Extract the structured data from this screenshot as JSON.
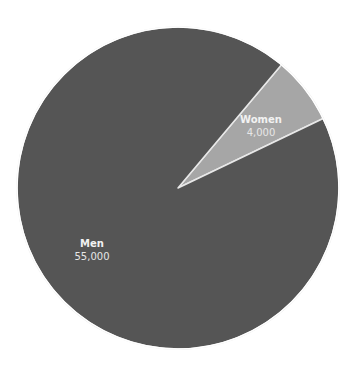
{
  "chart_data": {
    "type": "pie",
    "title": "",
    "categories": [
      "Men",
      "Women"
    ],
    "values": [
      55000,
      4000
    ],
    "value_labels": [
      "55,000",
      "4,000"
    ],
    "colors": [
      "#555555",
      "#a6a6a6"
    ],
    "start_angle_deg": 40,
    "legend": "none",
    "labels_inside": true
  },
  "labels": {
    "men": {
      "name": "Men",
      "value": "55,000"
    },
    "women": {
      "name": "Women",
      "value": "4,000"
    }
  },
  "style": {
    "slice_border_color": "#e8e8e8",
    "background": "#ffffff"
  }
}
